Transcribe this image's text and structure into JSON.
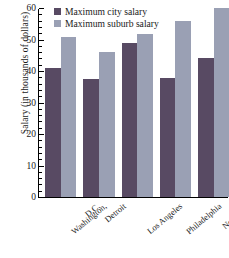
{
  "chart_data": {
    "type": "bar",
    "title": "",
    "xlabel": "",
    "ylabel": "Salary (in thousands of dollars)",
    "categories": [
      "Washington, D.C.",
      "Detroit",
      "Los Angeles",
      "Philadelphia",
      "New York"
    ],
    "category_labels": [
      [
        "Washington,",
        "D.C."
      ],
      [
        "Detroit"
      ],
      [
        "Los Angeles"
      ],
      [
        "Philadelphia"
      ],
      [
        "New York"
      ]
    ],
    "series": [
      {
        "name": "Maximum city salary",
        "color": "#584a63",
        "values": [
          41,
          37.5,
          48.7,
          37.8,
          44
        ]
      },
      {
        "name": "Maximum suburb salary",
        "color": "#9aa0b4",
        "values": [
          50.8,
          45.9,
          51.5,
          55.8,
          60
        ]
      }
    ],
    "ylim": [
      0,
      60
    ],
    "ytick_labels": [
      "0",
      "10",
      "20",
      "30",
      "40",
      "50",
      "60"
    ],
    "ytick_values": [
      0,
      10,
      20,
      30,
      40,
      50,
      60
    ],
    "yminor_step": 2,
    "grid": false,
    "legend_position": "top-left-inside"
  },
  "legend": {
    "items": [
      {
        "label": "Maximum city salary",
        "swatch": "city"
      },
      {
        "label": "Maximum suburb salary",
        "swatch": "suburb"
      }
    ]
  }
}
